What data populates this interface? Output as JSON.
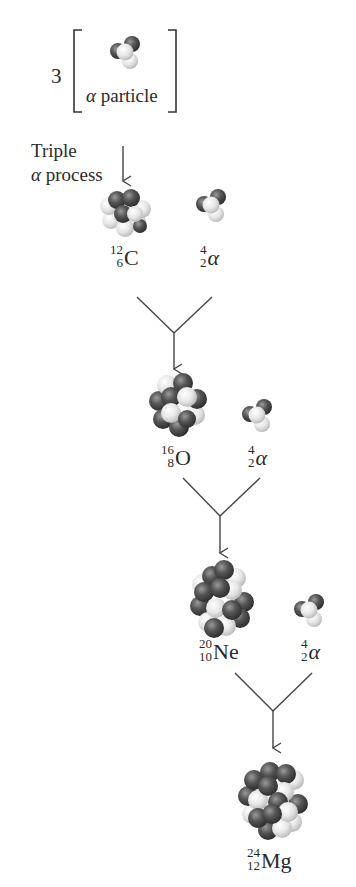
{
  "header": {
    "multiplier": "3",
    "bracket_label_greek": "α",
    "bracket_label_text": " particle"
  },
  "process_label": {
    "line1": "Triple",
    "line2_greek": "α",
    "line2_text": " process"
  },
  "steps": [
    {
      "nucleus": {
        "mass": "12",
        "atomic": "6",
        "symbol": "C"
      },
      "alpha": {
        "mass": "4",
        "atomic": "2",
        "symbol": "α"
      }
    },
    {
      "nucleus": {
        "mass": "16",
        "atomic": "8",
        "symbol": "O"
      },
      "alpha": {
        "mass": "4",
        "atomic": "2",
        "symbol": "α"
      }
    },
    {
      "nucleus": {
        "mass": "20",
        "atomic": "10",
        "symbol": "Ne"
      },
      "alpha": {
        "mass": "4",
        "atomic": "2",
        "symbol": "α"
      }
    }
  ],
  "product": {
    "mass": "24",
    "atomic": "12",
    "symbol": "Mg"
  },
  "colors": {
    "proton": "#4a4a4a",
    "neutron": "#e8e8e8",
    "line": "#444444",
    "text": "#2a2a2a"
  }
}
